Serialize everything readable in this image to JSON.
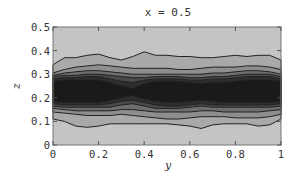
{
  "chart_data": {
    "type": "contour",
    "title": "x = 0.5",
    "xlabel": "y",
    "ylabel": "z",
    "xlim": [
      0,
      1
    ],
    "ylim": [
      0,
      0.5
    ],
    "xticks": [
      "0",
      "0.2",
      "0.4",
      "0.6",
      "0.8",
      "1"
    ],
    "xtick_values": [
      0,
      0.2,
      0.4,
      0.6,
      0.8,
      1
    ],
    "yticks": [
      "0",
      "0.1",
      "0.2",
      "0.3",
      "0.4",
      "0.5"
    ],
    "ytick_values": [
      0,
      0.1,
      0.2,
      0.3,
      0.4,
      0.5
    ],
    "grid": false,
    "legend": null,
    "colormap": "grayscale (darker = higher value)",
    "background_fill": "#c4c4c4",
    "y_samples": [
      0,
      0.05,
      0.1,
      0.15,
      0.2,
      0.25,
      0.3,
      0.35,
      0.4,
      0.45,
      0.5,
      0.55,
      0.6,
      0.65,
      0.7,
      0.75,
      0.8,
      0.85,
      0.9,
      0.95,
      1
    ],
    "contour_bands": [
      {
        "level": 1,
        "fill": "#a9a9a9",
        "upper": [
          0.34,
          0.37,
          0.37,
          0.38,
          0.385,
          0.37,
          0.36,
          0.375,
          0.395,
          0.38,
          0.38,
          0.375,
          0.375,
          0.37,
          0.37,
          0.375,
          0.38,
          0.375,
          0.38,
          0.38,
          0.36
        ],
        "lower": [
          0.11,
          0.1,
          0.08,
          0.075,
          0.08,
          0.09,
          0.09,
          0.09,
          0.09,
          0.09,
          0.09,
          0.085,
          0.08,
          0.07,
          0.085,
          0.09,
          0.09,
          0.09,
          0.08,
          0.085,
          0.11
        ]
      },
      {
        "level": 2,
        "fill": "#8e8e8e",
        "upper": [
          0.305,
          0.32,
          0.33,
          0.335,
          0.34,
          0.335,
          0.33,
          0.325,
          0.325,
          0.325,
          0.325,
          0.32,
          0.32,
          0.325,
          0.33,
          0.33,
          0.33,
          0.335,
          0.335,
          0.33,
          0.32
        ],
        "lower": [
          0.14,
          0.135,
          0.13,
          0.125,
          0.125,
          0.125,
          0.13,
          0.125,
          0.12,
          0.115,
          0.11,
          0.11,
          0.115,
          0.12,
          0.12,
          0.12,
          0.115,
          0.115,
          0.115,
          0.12,
          0.13
        ]
      },
      {
        "level": 3,
        "fill": "#6e6e6e",
        "upper": [
          0.295,
          0.305,
          0.31,
          0.315,
          0.315,
          0.31,
          0.305,
          0.3,
          0.3,
          0.3,
          0.3,
          0.3,
          0.3,
          0.3,
          0.305,
          0.305,
          0.31,
          0.315,
          0.315,
          0.31,
          0.3
        ],
        "lower": [
          0.155,
          0.15,
          0.145,
          0.145,
          0.145,
          0.145,
          0.15,
          0.15,
          0.145,
          0.14,
          0.14,
          0.14,
          0.14,
          0.145,
          0.145,
          0.14,
          0.14,
          0.14,
          0.14,
          0.145,
          0.15
        ]
      },
      {
        "level": 4,
        "fill": "#4a4a4a",
        "upper": [
          0.29,
          0.295,
          0.295,
          0.3,
          0.3,
          0.295,
          0.29,
          0.285,
          0.285,
          0.29,
          0.29,
          0.29,
          0.285,
          0.285,
          0.29,
          0.29,
          0.295,
          0.3,
          0.3,
          0.3,
          0.29
        ],
        "lower": [
          0.165,
          0.16,
          0.16,
          0.16,
          0.16,
          0.16,
          0.17,
          0.175,
          0.165,
          0.155,
          0.155,
          0.155,
          0.16,
          0.165,
          0.16,
          0.16,
          0.16,
          0.16,
          0.16,
          0.16,
          0.165
        ]
      },
      {
        "level": 5,
        "fill": "#2e2e2e",
        "upper": [
          0.28,
          0.285,
          0.285,
          0.29,
          0.29,
          0.28,
          0.27,
          0.265,
          0.275,
          0.28,
          0.28,
          0.28,
          0.275,
          0.275,
          0.28,
          0.28,
          0.285,
          0.29,
          0.29,
          0.29,
          0.28
        ],
        "lower": [
          0.175,
          0.17,
          0.17,
          0.17,
          0.17,
          0.175,
          0.185,
          0.19,
          0.18,
          0.17,
          0.165,
          0.165,
          0.17,
          0.175,
          0.17,
          0.17,
          0.17,
          0.17,
          0.17,
          0.17,
          0.175
        ]
      },
      {
        "level": 6,
        "fill": "#1a1a1a",
        "upper": [
          0.27,
          0.275,
          0.275,
          0.275,
          0.275,
          0.265,
          0.25,
          0.24,
          0.26,
          0.27,
          0.27,
          0.27,
          0.265,
          0.26,
          0.265,
          0.265,
          0.27,
          0.275,
          0.275,
          0.275,
          0.27
        ],
        "lower": [
          0.185,
          0.18,
          0.18,
          0.18,
          0.18,
          0.19,
          0.2,
          0.21,
          0.195,
          0.185,
          0.18,
          0.18,
          0.185,
          0.19,
          0.185,
          0.18,
          0.18,
          0.18,
          0.18,
          0.18,
          0.185
        ]
      }
    ],
    "annotations": []
  }
}
